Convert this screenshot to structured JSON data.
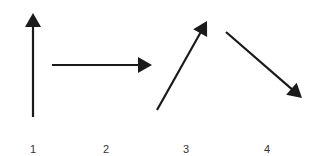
{
  "diagram": {
    "stroke_color": "#1a1a1a",
    "label_color": "#333333",
    "arrows": [
      {
        "id": "1",
        "label": "1",
        "direction": "up",
        "x1": 33,
        "y1": 117,
        "x2": 33,
        "y2": 13,
        "label_x": 33
      },
      {
        "id": "2",
        "label": "2",
        "direction": "right",
        "x1": 52,
        "y1": 65,
        "x2": 152,
        "y2": 65,
        "label_x": 106
      },
      {
        "id": "3",
        "label": "3",
        "direction": "up-right",
        "x1": 157,
        "y1": 110,
        "x2": 207,
        "y2": 21,
        "label_x": 186
      },
      {
        "id": "4",
        "label": "4",
        "direction": "down-right",
        "x1": 226,
        "y1": 32,
        "x2": 302,
        "y2": 98,
        "label_x": 267
      }
    ]
  }
}
